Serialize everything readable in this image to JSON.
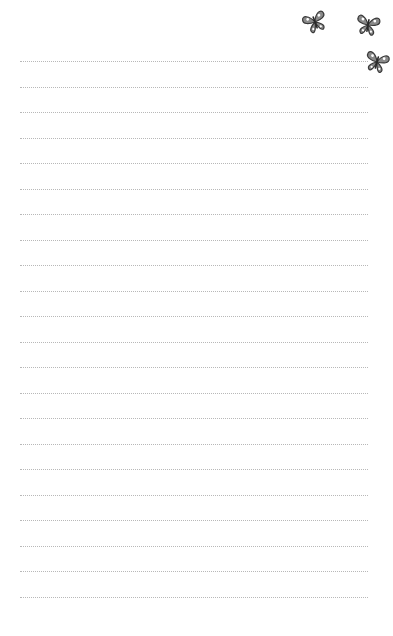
{
  "paper": {
    "background": "#ffffff",
    "line_color": "#b8b8b8",
    "line_style": "dotted",
    "line_left": 20,
    "line_width": 348,
    "first_line_y": 61,
    "line_spacing": 25.5,
    "line_count": 22
  },
  "decorations": [
    {
      "icon": "butterfly-icon",
      "x": 302,
      "y": 10,
      "rotate": -20
    },
    {
      "icon": "butterfly-icon",
      "x": 355,
      "y": 13,
      "rotate": 10
    },
    {
      "icon": "butterfly-icon",
      "x": 364,
      "y": 50,
      "rotate": 15
    }
  ]
}
